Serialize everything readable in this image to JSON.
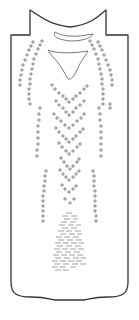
{
  "figure": {
    "stroke_color": "#333333",
    "mark_color": "#666666",
    "background": "#ffffff"
  },
  "outline": {
    "path": "M30 10 C38 14 46 24 70 27 C94 24 100 14 106 10 L106 35 L128 35 L128 282 C128 294 122 297 108 297 C92 297 88 300 84 300 L55 300 C51 300 47 297 31 297 C17 297 11 294 11 282 L11 35 L30 35 Z"
  },
  "collar_band": {
    "path": "M55 32 C53 36 55 39 70 41 C85 41 92 37 93 34 C86 35 78 37 70 36 C62 36 57 33 55 32 Z"
  },
  "neck_opening": {
    "path": "M48 50 C54 53 70 54 88 51 C84 58 80 62 76 72 C73 78 70 80 68 79 C64 72 60 64 54 58 C51 55 49 52 48 50 Z"
  },
  "cross_groups": [
    {
      "name": "left-outer-arc",
      "points": [
        [
          33,
          42
        ],
        [
          31,
          46
        ],
        [
          29,
          50
        ],
        [
          27,
          55
        ],
        [
          25,
          60
        ],
        [
          23,
          65
        ],
        [
          22,
          70
        ],
        [
          21,
          75
        ],
        [
          20,
          80
        ],
        [
          20,
          85
        ]
      ]
    },
    {
      "name": "left-inner-arc",
      "points": [
        [
          42,
          41
        ],
        [
          40,
          45
        ],
        [
          38,
          49
        ],
        [
          36,
          54
        ],
        [
          34,
          59
        ],
        [
          33,
          64
        ],
        [
          32,
          69
        ],
        [
          31,
          74
        ],
        [
          30,
          79
        ],
        [
          30,
          84
        ],
        [
          29,
          89
        ],
        [
          29,
          94
        ],
        [
          29,
          99
        ],
        [
          30,
          104
        ]
      ]
    },
    {
      "name": "left-column-mid",
      "points": [
        [
          40,
          108
        ],
        [
          39,
          114
        ],
        [
          39,
          120
        ],
        [
          38,
          126
        ],
        [
          38,
          132
        ],
        [
          38,
          138
        ],
        [
          38,
          144
        ],
        [
          37,
          150
        ],
        [
          37,
          156
        ]
      ]
    },
    {
      "name": "left-column-low",
      "points": [
        [
          46,
          171
        ],
        [
          45,
          176
        ],
        [
          45,
          181
        ],
        [
          44,
          186
        ],
        [
          44,
          191
        ],
        [
          43,
          196
        ],
        [
          43,
          201
        ],
        [
          43,
          206
        ],
        [
          43,
          211
        ],
        [
          43,
          216
        ],
        [
          43,
          221
        ]
      ]
    },
    {
      "name": "right-outer-arc",
      "points": [
        [
          98,
          42
        ],
        [
          100,
          46
        ],
        [
          102,
          50
        ],
        [
          104,
          55
        ],
        [
          106,
          60
        ],
        [
          108,
          65
        ],
        [
          110,
          70
        ],
        [
          111,
          75
        ],
        [
          112,
          80
        ],
        [
          112,
          85
        ]
      ]
    },
    {
      "name": "right-inner-arc",
      "points": [
        [
          90,
          41
        ],
        [
          92,
          45
        ],
        [
          94,
          49
        ],
        [
          96,
          54
        ],
        [
          98,
          59
        ],
        [
          99,
          64
        ],
        [
          100,
          69
        ],
        [
          101,
          74
        ],
        [
          102,
          79
        ],
        [
          102,
          84
        ],
        [
          103,
          89
        ],
        [
          103,
          94
        ],
        [
          103,
          99
        ],
        [
          103,
          104
        ],
        [
          110,
          104
        ],
        [
          110,
          108
        ]
      ]
    },
    {
      "name": "right-column-mid",
      "points": [
        [
          99,
          108
        ],
        [
          100,
          114
        ],
        [
          100,
          120
        ],
        [
          101,
          126
        ],
        [
          101,
          132
        ],
        [
          101,
          138
        ],
        [
          101,
          144
        ],
        [
          101,
          150
        ],
        [
          101,
          156
        ]
      ]
    },
    {
      "name": "right-column-low",
      "points": [
        [
          93,
          171
        ],
        [
          94,
          176
        ],
        [
          94,
          181
        ],
        [
          94,
          186
        ],
        [
          95,
          191
        ],
        [
          95,
          196
        ],
        [
          95,
          201
        ],
        [
          95,
          206
        ],
        [
          95,
          211
        ],
        [
          96,
          216
        ],
        [
          96,
          221
        ]
      ]
    },
    {
      "name": "chevron-1",
      "points": [
        [
          52,
          85
        ],
        [
          55,
          89
        ],
        [
          59,
          93
        ],
        [
          63,
          96
        ],
        [
          66,
          99
        ],
        [
          69,
          102
        ],
        [
          73,
          99
        ],
        [
          76,
          96
        ],
        [
          80,
          93
        ],
        [
          84,
          89
        ],
        [
          87,
          86
        ]
      ]
    },
    {
      "name": "chevron-2",
      "points": [
        [
          56,
          101
        ],
        [
          59,
          105
        ],
        [
          63,
          108
        ],
        [
          66,
          112
        ],
        [
          69,
          115
        ],
        [
          73,
          112
        ],
        [
          76,
          108
        ],
        [
          80,
          105
        ],
        [
          84,
          101
        ]
      ]
    },
    {
      "name": "chevron-3",
      "points": [
        [
          54,
          114
        ],
        [
          57,
          118
        ],
        [
          61,
          121
        ],
        [
          65,
          125
        ],
        [
          69,
          128
        ],
        [
          73,
          125
        ],
        [
          77,
          121
        ],
        [
          81,
          118
        ],
        [
          84,
          114
        ]
      ]
    },
    {
      "name": "chevron-4",
      "points": [
        [
          56,
          128
        ],
        [
          59,
          132
        ],
        [
          63,
          136
        ],
        [
          66,
          139
        ],
        [
          69,
          142
        ],
        [
          73,
          139
        ],
        [
          76,
          136
        ],
        [
          80,
          132
        ],
        [
          83,
          129
        ]
      ]
    },
    {
      "name": "chevron-5",
      "points": [
        [
          59,
          143
        ],
        [
          62,
          147
        ],
        [
          66,
          151
        ],
        [
          69,
          154
        ],
        [
          73,
          151
        ],
        [
          77,
          147
        ],
        [
          80,
          144
        ]
      ]
    },
    {
      "name": "chevron-6",
      "points": [
        [
          61,
          158
        ],
        [
          64,
          162
        ],
        [
          67,
          166
        ],
        [
          70,
          169
        ],
        [
          73,
          166
        ],
        [
          77,
          162
        ],
        [
          79,
          159
        ]
      ]
    },
    {
      "name": "chevron-7",
      "points": [
        [
          60,
          170
        ],
        [
          63,
          174
        ],
        [
          66,
          177
        ],
        [
          69,
          180
        ],
        [
          73,
          177
        ],
        [
          76,
          174
        ],
        [
          79,
          171
        ]
      ]
    },
    {
      "name": "chevron-8",
      "points": [
        [
          62,
          185
        ],
        [
          65,
          189
        ],
        [
          69,
          192
        ],
        [
          73,
          189
        ],
        [
          76,
          186
        ]
      ]
    },
    {
      "name": "small-pair",
      "points": [
        [
          65,
          199
        ],
        [
          70,
          203
        ],
        [
          74,
          199
        ]
      ]
    }
  ],
  "dash_rows": [
    {
      "y": 213,
      "dashes": [
        [
          66,
          72
        ]
      ]
    },
    {
      "y": 216,
      "dashes": [
        [
          62,
          68
        ],
        [
          71,
          77
        ]
      ]
    },
    {
      "y": 219,
      "dashes": [
        [
          64,
          70
        ],
        [
          73,
          78
        ]
      ]
    },
    {
      "y": 222,
      "dashes": [
        [
          61,
          67
        ],
        [
          70,
          76
        ]
      ]
    },
    {
      "y": 225,
      "dashes": [
        [
          59,
          65
        ],
        [
          68,
          74
        ],
        [
          76,
          81
        ]
      ]
    },
    {
      "y": 228,
      "dashes": [
        [
          62,
          68
        ],
        [
          71,
          77
        ]
      ]
    },
    {
      "y": 231,
      "dashes": [
        [
          58,
          64
        ],
        [
          66,
          72
        ],
        [
          75,
          81
        ]
      ]
    },
    {
      "y": 234,
      "dashes": [
        [
          60,
          66
        ],
        [
          69,
          75
        ],
        [
          77,
          82
        ]
      ]
    },
    {
      "y": 237,
      "dashes": [
        [
          56,
          62
        ],
        [
          64,
          70
        ],
        [
          73,
          79
        ]
      ]
    },
    {
      "y": 240,
      "dashes": [
        [
          58,
          64
        ],
        [
          67,
          73
        ],
        [
          76,
          82
        ]
      ]
    },
    {
      "y": 243,
      "dashes": [
        [
          55,
          61
        ],
        [
          63,
          69
        ],
        [
          71,
          77
        ],
        [
          79,
          84
        ]
      ]
    },
    {
      "y": 246,
      "dashes": [
        [
          57,
          63
        ],
        [
          66,
          72
        ],
        [
          75,
          81
        ]
      ]
    },
    {
      "y": 249,
      "dashes": [
        [
          54,
          60
        ],
        [
          62,
          68
        ],
        [
          70,
          76
        ],
        [
          78,
          84
        ]
      ]
    },
    {
      "y": 252,
      "dashes": [
        [
          56,
          62
        ],
        [
          65,
          71
        ],
        [
          74,
          80
        ]
      ]
    },
    {
      "y": 255,
      "dashes": [
        [
          53,
          59
        ],
        [
          61,
          67
        ],
        [
          69,
          75
        ],
        [
          77,
          83
        ]
      ]
    },
    {
      "y": 258,
      "dashes": [
        [
          55,
          61
        ],
        [
          64,
          70
        ],
        [
          73,
          79
        ],
        [
          81,
          86
        ]
      ]
    },
    {
      "y": 261,
      "dashes": [
        [
          52,
          58
        ],
        [
          60,
          66
        ],
        [
          68,
          74
        ],
        [
          76,
          82
        ]
      ]
    },
    {
      "y": 264,
      "dashes": [
        [
          54,
          60
        ],
        [
          63,
          69
        ],
        [
          72,
          78
        ],
        [
          80,
          86
        ]
      ]
    },
    {
      "y": 267,
      "dashes": [
        [
          52,
          58
        ],
        [
          60,
          66
        ],
        [
          70,
          76
        ]
      ]
    },
    {
      "y": 270,
      "dashes": [
        [
          55,
          61
        ],
        [
          63,
          69
        ]
      ]
    }
  ]
}
